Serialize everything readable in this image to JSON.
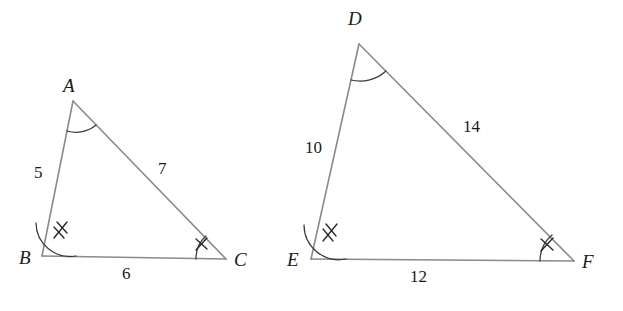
{
  "figure": {
    "kind": "similar-triangles-diagram",
    "background_color": "#ffffff",
    "stroke_color": "#8a8a8a",
    "mark_color": "#2b2b2b",
    "triangles": [
      {
        "id": "triangle-abc",
        "name": "Triangle ABC",
        "vertices": [
          {
            "key": "A",
            "label": "A",
            "x": 73,
            "y": 101,
            "label_x": 63,
            "label_y": 76
          },
          {
            "key": "B",
            "label": "B",
            "x": 42,
            "y": 256,
            "label_x": 19,
            "label_y": 248
          },
          {
            "key": "C",
            "label": "C",
            "x": 226,
            "y": 259,
            "label_x": 234,
            "label_y": 250
          }
        ],
        "sides": [
          {
            "key": "AB",
            "label": "5",
            "label_x": 34,
            "label_y": 164
          },
          {
            "key": "AC",
            "label": "7",
            "label_x": 158,
            "label_y": 160
          },
          {
            "key": "BC",
            "label": "6",
            "label_x": 122,
            "label_y": 265
          }
        ],
        "angles": [
          {
            "key": "A",
            "marks": 0
          },
          {
            "key": "B",
            "marks": 2
          },
          {
            "key": "C",
            "marks": 1
          }
        ]
      },
      {
        "id": "triangle-def",
        "name": "Triangle DEF",
        "vertices": [
          {
            "key": "D",
            "label": "D",
            "x": 359,
            "y": 44,
            "label_x": 348,
            "label_y": 9
          },
          {
            "key": "E",
            "label": "E",
            "x": 311,
            "y": 259,
            "label_x": 287,
            "label_y": 250
          },
          {
            "key": "F",
            "label": "F",
            "x": 574,
            "y": 261,
            "label_x": 582,
            "label_y": 252
          }
        ],
        "sides": [
          {
            "key": "DE",
            "label": "10",
            "label_x": 305,
            "label_y": 139
          },
          {
            "key": "DF",
            "label": "14",
            "label_x": 463,
            "label_y": 118
          },
          {
            "key": "EF",
            "label": "12",
            "label_x": 410,
            "label_y": 268
          }
        ],
        "angles": [
          {
            "key": "D",
            "marks": 0
          },
          {
            "key": "E",
            "marks": 2
          },
          {
            "key": "F",
            "marks": 1
          }
        ]
      }
    ]
  }
}
